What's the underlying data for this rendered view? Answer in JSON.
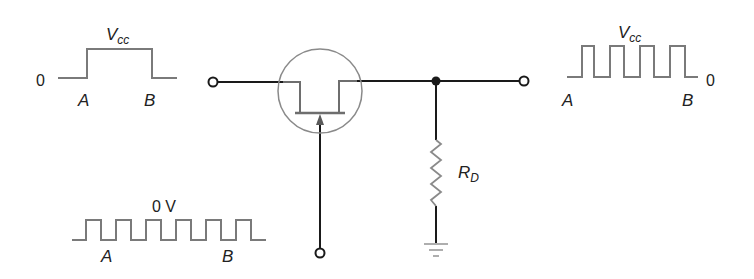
{
  "diagram": {
    "type": "circuit-schematic",
    "colors": {
      "wire": "#1a1a1a",
      "component": "#8a8a8a",
      "waveform": "#7a7a7a",
      "text": "#222222",
      "background": "#ffffff"
    },
    "input_waveform": {
      "label_high": "V",
      "label_high_sub": "cc",
      "label_low": "0",
      "label_start": "A",
      "label_end": "B",
      "shape": "single-pulse"
    },
    "gate_waveform": {
      "label_level": "0 V",
      "label_start": "A",
      "label_end": "B",
      "shape": "square-wave",
      "cycles": 6
    },
    "output_waveform": {
      "label_high": "V",
      "label_high_sub": "cc",
      "label_low": "0",
      "label_start": "A",
      "label_end": "B",
      "shape": "chopped-pulse",
      "cycles": 4
    },
    "components": {
      "transistor": "JFET (n-channel)",
      "resistor_label": "R",
      "resistor_label_sub": "D",
      "ground": "ground"
    },
    "terminals": [
      "input",
      "output",
      "gate"
    ]
  }
}
